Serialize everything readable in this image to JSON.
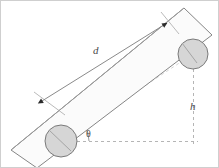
{
  "figure": {
    "type": "physics-diagram",
    "background_color": "#ffffff",
    "border_color": "#cfcfcf",
    "stroke_color": "#777777",
    "dimension_line_color": "#8a8a8a",
    "dashed_line_color": "#b5b5b5",
    "wheel_fill_color": "#d6d6d6",
    "wheel_stroke_color": "#7a7a7a",
    "board_fill_color": "#fbfbfb",
    "board_stroke_color": "#808080",
    "label_color": "#4a4a4a"
  },
  "labels": {
    "distance": "d",
    "height": "h",
    "angle": "θ"
  },
  "geometry": {
    "incline_angle_deg": 34,
    "board": {
      "corners": [
        {
          "x": 10,
          "y": 149
        },
        {
          "x": 183,
          "y": 7
        },
        {
          "x": 211,
          "y": 34
        },
        {
          "x": 36,
          "y": 167
        }
      ]
    },
    "wheels": [
      {
        "name": "lower-wheel",
        "cx": 60,
        "cy": 140,
        "r": 16
      },
      {
        "name": "upper-wheel",
        "cx": 192,
        "cy": 53,
        "r": 15
      }
    ],
    "dimension_line": {
      "from": {
        "x": 40,
        "y": 100
      },
      "to": {
        "x": 167,
        "y": 21
      },
      "arrowheads": "both"
    },
    "extension_ticks": [
      {
        "from": {
          "x": 34,
          "y": 92
        },
        "to": {
          "x": 63,
          "y": 113
        }
      },
      {
        "from": {
          "x": 161,
          "y": 12
        },
        "to": {
          "x": 177,
          "y": 32
        }
      }
    ],
    "triangle": {
      "horizontal": {
        "from": {
          "x": 60,
          "y": 140
        },
        "to": {
          "x": 196,
          "y": 140
        }
      },
      "vertical": {
        "from": {
          "x": 192,
          "y": 45
        },
        "to": {
          "x": 192,
          "y": 145
        }
      },
      "angle_arc": {
        "cx": 60,
        "cy": 140,
        "r": 28,
        "start_deg": 0,
        "end_deg": 34
      }
    },
    "label_positions": {
      "distance": {
        "x": 92,
        "y": 44
      },
      "height": {
        "x": 189,
        "y": 100
      },
      "angle": {
        "x": 85,
        "y": 128
      }
    }
  }
}
